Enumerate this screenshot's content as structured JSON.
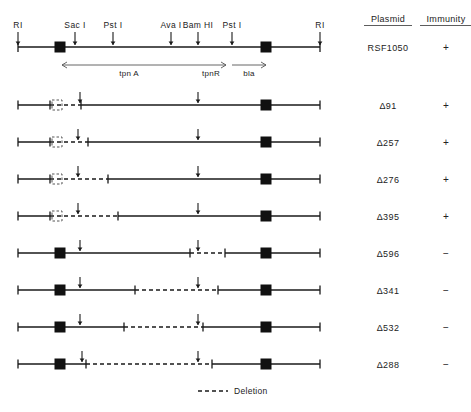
{
  "figure": {
    "type": "restriction-map-deletion-diagram",
    "legend": {
      "label": "Deletion",
      "style": "dashed-line"
    },
    "columns": {
      "plasmid_header": "Plasmid",
      "immunity_header": "Immunity"
    }
  },
  "reference_map": {
    "plasmid": "RSF1050",
    "immunity": "+",
    "sites": [
      {
        "name": "RI",
        "x": 18
      },
      {
        "name": "Sac I",
        "x": 75
      },
      {
        "name": "Pst I",
        "x": 113
      },
      {
        "name": "Ava I",
        "x": 171
      },
      {
        "name": "Bam HI",
        "x": 198
      },
      {
        "name": "Pst I",
        "x": 232
      },
      {
        "name": "RI",
        "x": 320
      }
    ],
    "is_elements": [
      {
        "x": 60,
        "label": "IS-element-left"
      },
      {
        "x": 266,
        "label": "IS-element-right"
      }
    ],
    "genes": [
      {
        "name": "tpn A",
        "x1": 62,
        "x2": 196,
        "direction": "left"
      },
      {
        "name": "tpnR",
        "x1": 196,
        "x2": 226,
        "direction": "right"
      },
      {
        "name": "bla",
        "x1": 232,
        "x2": 266,
        "direction": "right"
      }
    ]
  },
  "rows": [
    {
      "plasmid": "Δ91",
      "immunity": "+",
      "y": 105,
      "left_box": {
        "type": "open",
        "x": 57
      },
      "arrows": [
        {
          "x": 80
        },
        {
          "x": 198
        }
      ],
      "right_box": {
        "type": "filled",
        "x": 266
      },
      "deletion": {
        "x1": 50,
        "x2": 80
      },
      "ticks": [
        18,
        50,
        81,
        320
      ]
    },
    {
      "plasmid": "Δ257",
      "immunity": "+",
      "y": 142,
      "left_box": {
        "type": "open",
        "x": 57
      },
      "arrows": [
        {
          "x": 78
        },
        {
          "x": 198
        }
      ],
      "right_box": {
        "type": "filled",
        "x": 266
      },
      "deletion": {
        "x1": 50,
        "x2": 88
      },
      "ticks": [
        18,
        50,
        88,
        320
      ]
    },
    {
      "plasmid": "Δ276",
      "immunity": "+",
      "y": 179,
      "left_box": {
        "type": "open",
        "x": 57
      },
      "arrows": [
        {
          "x": 78
        },
        {
          "x": 198
        }
      ],
      "right_box": {
        "type": "filled",
        "x": 266
      },
      "deletion": {
        "x1": 50,
        "x2": 108
      },
      "ticks": [
        18,
        50,
        108,
        320
      ]
    },
    {
      "plasmid": "Δ395",
      "immunity": "+",
      "y": 216,
      "left_box": {
        "type": "open",
        "x": 57
      },
      "arrows": [
        {
          "x": 78
        },
        {
          "x": 198
        }
      ],
      "right_box": {
        "type": "filled",
        "x": 266
      },
      "deletion": {
        "x1": 50,
        "x2": 118
      },
      "ticks": [
        18,
        50,
        118,
        320
      ]
    },
    {
      "plasmid": "Δ596",
      "immunity": "−",
      "y": 253,
      "left_box": {
        "type": "filled",
        "x": 60
      },
      "arrows": [
        {
          "x": 80
        },
        {
          "x": 198
        }
      ],
      "right_box": {
        "type": "filled",
        "x": 266
      },
      "deletion": {
        "x1": 190,
        "x2": 225
      },
      "ticks": [
        18,
        190,
        225,
        320
      ]
    },
    {
      "plasmid": "Δ341",
      "immunity": "−",
      "y": 290,
      "left_box": {
        "type": "filled",
        "x": 60
      },
      "arrows": [
        {
          "x": 80
        },
        {
          "x": 198
        }
      ],
      "right_box": {
        "type": "filled",
        "x": 266
      },
      "deletion": {
        "x1": 135,
        "x2": 218
      },
      "ticks": [
        18,
        135,
        218,
        320
      ]
    },
    {
      "plasmid": "Δ532",
      "immunity": "−",
      "y": 327,
      "left_box": {
        "type": "filled",
        "x": 60
      },
      "arrows": [
        {
          "x": 80
        },
        {
          "x": 198
        }
      ],
      "right_box": {
        "type": "filled",
        "x": 266
      },
      "deletion": {
        "x1": 124,
        "x2": 203
      },
      "ticks": [
        18,
        124,
        203,
        320
      ]
    },
    {
      "plasmid": "Δ288",
      "immunity": "−",
      "y": 364,
      "left_box": {
        "type": "filled",
        "x": 60
      },
      "arrows": [
        {
          "x": 82
        },
        {
          "x": 198
        }
      ],
      "right_box": {
        "type": "filled",
        "x": 266
      },
      "deletion": {
        "x1": 86,
        "x2": 212
      },
      "ticks": [
        18,
        86,
        212,
        320
      ]
    }
  ],
  "layout": {
    "plasmid_col_x": 388,
    "immunity_col_x": 446,
    "map_y": 47,
    "legend_x": 232,
    "legend_y": 391
  }
}
